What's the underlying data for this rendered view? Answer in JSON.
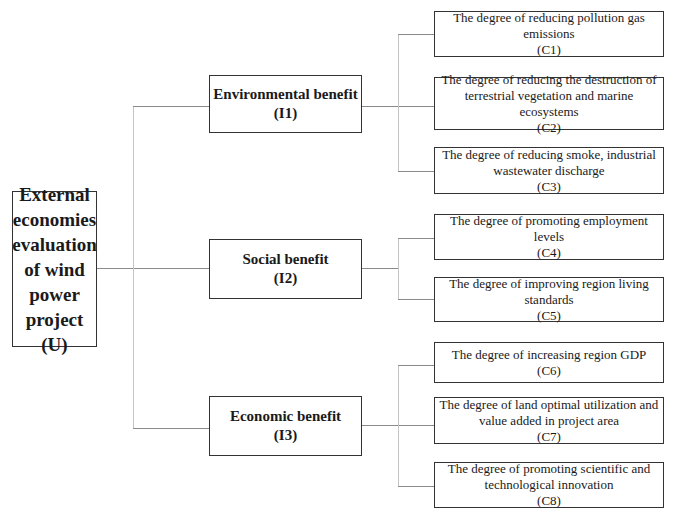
{
  "diagram": {
    "type": "hierarchy",
    "root": {
      "id": "U",
      "lines": [
        "External",
        "economies",
        "evaluation",
        "of wind",
        "power",
        "project",
        "(U)"
      ]
    },
    "criteria": [
      {
        "id": "I1",
        "title": "Environmental benefit",
        "code": "(I1)",
        "indicators": [
          {
            "id": "C1",
            "lines": [
              "The degree of reducing pollution gas",
              "emissions",
              "(C1)"
            ]
          },
          {
            "id": "C2",
            "lines": [
              "The degree of reducing the destruction of",
              "terrestrial vegetation and marine ecosystems",
              "(C2)"
            ]
          },
          {
            "id": "C3",
            "lines": [
              "The degree of reducing smoke, industrial",
              "wastewater discharge",
              "(C3)"
            ]
          }
        ]
      },
      {
        "id": "I2",
        "title": "Social benefit",
        "code": "(I2)",
        "indicators": [
          {
            "id": "C4",
            "lines": [
              "The degree of promoting employment levels",
              "(C4)"
            ]
          },
          {
            "id": "C5",
            "lines": [
              "The degree of improving region living",
              "standards",
              "(C5)"
            ]
          }
        ]
      },
      {
        "id": "I3",
        "title": "Economic benefit",
        "code": "(I3)",
        "indicators": [
          {
            "id": "C6",
            "lines": [
              "The degree of increasing region GDP",
              "(C6)"
            ]
          },
          {
            "id": "C7",
            "lines": [
              "The degree of land optimal utilization and",
              "value added in project area",
              "(C7)"
            ]
          },
          {
            "id": "C8",
            "lines": [
              "The degree of promoting scientific and",
              "technological innovation",
              "(C8)"
            ]
          }
        ]
      }
    ]
  }
}
